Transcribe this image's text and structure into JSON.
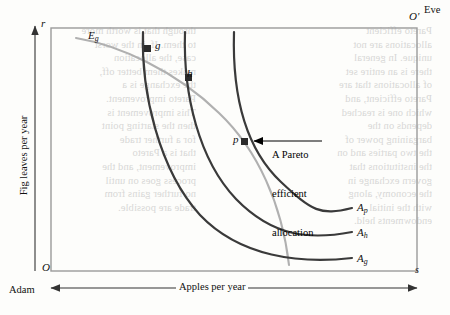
{
  "figure": {
    "type": "edgeworth-box",
    "axes": {
      "x_label": "Apples per year",
      "y_label": "Fig leaves per year",
      "origin_adam": "O",
      "origin_eve": "O'",
      "corner_top_left": "r",
      "corner_bottom_right": "s",
      "actor_left": "Adam",
      "actor_right": "Eve"
    },
    "curves": [
      {
        "id": "Eg",
        "label": "E",
        "subscript": "g",
        "color": "#b0b0b0",
        "owner": "Eve",
        "width": 2.0
      },
      {
        "id": "Ag",
        "label": "A",
        "subscript": "g",
        "color": "#3a3a3a",
        "owner": "Adam",
        "width": 2.2
      },
      {
        "id": "Ah",
        "label": "A",
        "subscript": "h",
        "color": "#3a3a3a",
        "owner": "Adam",
        "width": 2.2
      },
      {
        "id": "Ap",
        "label": "A",
        "subscript": "p",
        "color": "#3a3a3a",
        "owner": "Adam",
        "width": 2.2
      }
    ],
    "points": [
      {
        "id": "g",
        "label": "g",
        "x": 148,
        "y": 49,
        "marker": "square"
      },
      {
        "id": "h",
        "label": "h",
        "x": 189,
        "y": 78,
        "marker": "square"
      },
      {
        "id": "p",
        "label": "p",
        "x": 245,
        "y": 142,
        "marker": "square"
      }
    ],
    "annotation": {
      "line1": "A Pareto",
      "line2": "efficient",
      "line3": "allocation",
      "points_to": "p"
    },
    "colors": {
      "box_border": "#9a9a9a",
      "adam_curve": "#3a3a3a",
      "eve_curve": "#b0b0b0",
      "ink": "#111111",
      "paper": "#fdfdfb",
      "ghost_text": "#b9b9b9"
    }
  },
  "bleed_text": {
    "left": "through that is worth more\nto them. If, in the worst\ncase, the allocation\nmakes them better off,\nthe exchange is a\nPareto improvement.\nThis improvement is\nthen the starting point\nfor a further trade\nthat is a Pareto\nimprovement, and the\nprocess goes on until\nno further gains from\ntrade are possible.",
    "right": "Pareto efficient\nallocations are not\nunique. In general\nthere is an entire set\nof allocations that are\nPareto efficient, and\nwhich one is reached\ndepends on the\nbargaining power of\nthe two parties and on\nthe institutions that\ngovern exchange in\nthe economy, along\nwith the initial\nendowments held."
  }
}
